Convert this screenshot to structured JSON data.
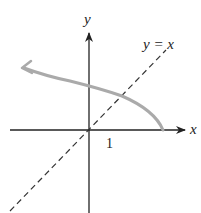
{
  "diagram": {
    "x_axis_label": "x",
    "y_axis_label": "y",
    "tick_label": "1",
    "line_label": "y = x",
    "curve_description": "Inverse-like curve starting at x-axis, rising leftward across y-axis with arrowhead",
    "colors": {
      "axes": "#222222",
      "dashed_line": "#333333",
      "curve": "#aaaaaa",
      "background": "#ffffff"
    }
  }
}
